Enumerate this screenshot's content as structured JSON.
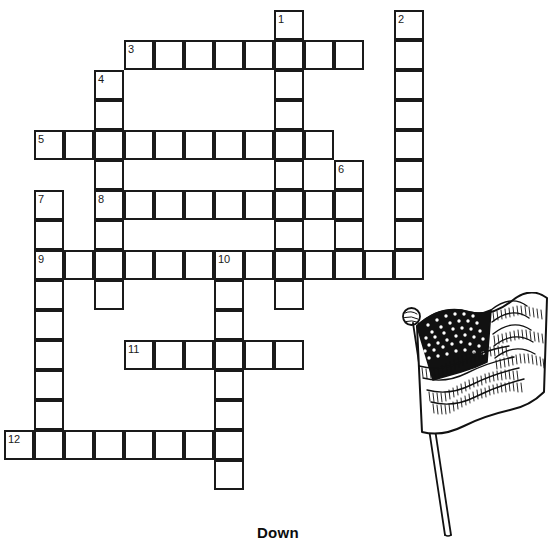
{
  "page": {
    "background_color": "#ffffff",
    "ink_color": "#1a1a1a",
    "width": 556,
    "height": 553
  },
  "heading": {
    "down_label": "Down"
  },
  "crossword": {
    "cell_size": 30,
    "origin_x": 4,
    "origin_y": 10,
    "columns_x": [
      4,
      34,
      64,
      94,
      124,
      154,
      184,
      214,
      244,
      274,
      304,
      334,
      364,
      394
    ],
    "rows_y": [
      10,
      40,
      70,
      100,
      130,
      160,
      190,
      220,
      250,
      280,
      310,
      340,
      370,
      400,
      430,
      460
    ],
    "clue_numbers": [
      {
        "number": "1",
        "col": 9,
        "row": 0
      },
      {
        "number": "2",
        "col": 13,
        "row": 0
      },
      {
        "number": "3",
        "col": 4,
        "row": 1
      },
      {
        "number": "4",
        "col": 3,
        "row": 2
      },
      {
        "number": "5",
        "col": 1,
        "row": 4
      },
      {
        "number": "6",
        "col": 11,
        "row": 5
      },
      {
        "number": "7",
        "col": 1,
        "row": 6
      },
      {
        "number": "8",
        "col": 3,
        "row": 6
      },
      {
        "number": "9",
        "col": 1,
        "row": 8
      },
      {
        "number": "10",
        "col": 7,
        "row": 8
      },
      {
        "number": "11",
        "col": 4,
        "row": 11
      },
      {
        "number": "12",
        "col": 0,
        "row": 14
      }
    ],
    "cells": [
      {
        "col": 9,
        "row": 0
      },
      {
        "col": 13,
        "row": 0
      },
      {
        "col": 4,
        "row": 1
      },
      {
        "col": 5,
        "row": 1
      },
      {
        "col": 6,
        "row": 1
      },
      {
        "col": 7,
        "row": 1
      },
      {
        "col": 8,
        "row": 1
      },
      {
        "col": 9,
        "row": 1
      },
      {
        "col": 10,
        "row": 1
      },
      {
        "col": 11,
        "row": 1
      },
      {
        "col": 13,
        "row": 1
      },
      {
        "col": 3,
        "row": 2
      },
      {
        "col": 9,
        "row": 2
      },
      {
        "col": 13,
        "row": 2
      },
      {
        "col": 3,
        "row": 3
      },
      {
        "col": 9,
        "row": 3
      },
      {
        "col": 13,
        "row": 3
      },
      {
        "col": 1,
        "row": 4
      },
      {
        "col": 2,
        "row": 4
      },
      {
        "col": 3,
        "row": 4
      },
      {
        "col": 4,
        "row": 4
      },
      {
        "col": 5,
        "row": 4
      },
      {
        "col": 6,
        "row": 4
      },
      {
        "col": 7,
        "row": 4
      },
      {
        "col": 8,
        "row": 4
      },
      {
        "col": 9,
        "row": 4
      },
      {
        "col": 10,
        "row": 4
      },
      {
        "col": 13,
        "row": 4
      },
      {
        "col": 3,
        "row": 5
      },
      {
        "col": 9,
        "row": 5
      },
      {
        "col": 11,
        "row": 5
      },
      {
        "col": 13,
        "row": 5
      },
      {
        "col": 1,
        "row": 6
      },
      {
        "col": 3,
        "row": 6
      },
      {
        "col": 4,
        "row": 6
      },
      {
        "col": 5,
        "row": 6
      },
      {
        "col": 6,
        "row": 6
      },
      {
        "col": 7,
        "row": 6
      },
      {
        "col": 8,
        "row": 6
      },
      {
        "col": 9,
        "row": 6
      },
      {
        "col": 10,
        "row": 6
      },
      {
        "col": 11,
        "row": 6
      },
      {
        "col": 13,
        "row": 6
      },
      {
        "col": 1,
        "row": 7
      },
      {
        "col": 3,
        "row": 7
      },
      {
        "col": 9,
        "row": 7
      },
      {
        "col": 11,
        "row": 7
      },
      {
        "col": 13,
        "row": 7
      },
      {
        "col": 1,
        "row": 8
      },
      {
        "col": 2,
        "row": 8
      },
      {
        "col": 3,
        "row": 8
      },
      {
        "col": 4,
        "row": 8
      },
      {
        "col": 5,
        "row": 8
      },
      {
        "col": 6,
        "row": 8
      },
      {
        "col": 7,
        "row": 8
      },
      {
        "col": 8,
        "row": 8
      },
      {
        "col": 9,
        "row": 8
      },
      {
        "col": 10,
        "row": 8
      },
      {
        "col": 11,
        "row": 8
      },
      {
        "col": 12,
        "row": 8
      },
      {
        "col": 13,
        "row": 8
      },
      {
        "col": 1,
        "row": 9
      },
      {
        "col": 3,
        "row": 9
      },
      {
        "col": 7,
        "row": 9
      },
      {
        "col": 9,
        "row": 9
      },
      {
        "col": 1,
        "row": 10
      },
      {
        "col": 7,
        "row": 10
      },
      {
        "col": 1,
        "row": 11
      },
      {
        "col": 4,
        "row": 11
      },
      {
        "col": 5,
        "row": 11
      },
      {
        "col": 6,
        "row": 11
      },
      {
        "col": 7,
        "row": 11
      },
      {
        "col": 8,
        "row": 11
      },
      {
        "col": 9,
        "row": 11
      },
      {
        "col": 1,
        "row": 12
      },
      {
        "col": 7,
        "row": 12
      },
      {
        "col": 1,
        "row": 13
      },
      {
        "col": 7,
        "row": 13
      },
      {
        "col": 0,
        "row": 14
      },
      {
        "col": 1,
        "row": 14
      },
      {
        "col": 2,
        "row": 14
      },
      {
        "col": 3,
        "row": 14
      },
      {
        "col": 4,
        "row": 14
      },
      {
        "col": 5,
        "row": 14
      },
      {
        "col": 6,
        "row": 14
      },
      {
        "col": 7,
        "row": 14
      },
      {
        "col": 7,
        "row": 15
      }
    ]
  },
  "illustration": {
    "name": "american-flag-drawing",
    "description": "Line drawing of the United States flag waving on a pole"
  }
}
